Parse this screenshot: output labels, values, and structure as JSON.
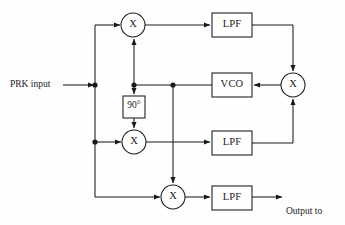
{
  "diagram": {
    "type": "block-diagram",
    "background_color": "#fefefe",
    "line_color": "#1a1a1a",
    "text_color": "#1a1a1a",
    "inputs": [
      {
        "id": "prk-input",
        "label": "PRK input"
      }
    ],
    "outputs": [
      {
        "id": "output-decision",
        "line1": "Output to",
        "line2": "decision",
        "line3": "threshold"
      }
    ],
    "blocks": [
      {
        "id": "mixer-top",
        "kind": "multiplier",
        "label": "X",
        "cx": 133,
        "cy": 25,
        "r": 12
      },
      {
        "id": "phase-shift-90",
        "kind": "box",
        "label": "90°",
        "x": 123,
        "y": 96,
        "w": 22,
        "h": 22
      },
      {
        "id": "mixer-middle",
        "kind": "multiplier",
        "label": "X",
        "cx": 134,
        "cy": 142,
        "r": 12
      },
      {
        "id": "mixer-bottom",
        "kind": "multiplier",
        "label": "X",
        "cx": 173,
        "cy": 197,
        "r": 12
      },
      {
        "id": "lpf-top",
        "kind": "box",
        "label": "LPF",
        "x": 212,
        "y": 13,
        "w": 40,
        "h": 24
      },
      {
        "id": "lpf-middle",
        "kind": "box",
        "label": "LPF",
        "x": 212,
        "y": 131,
        "w": 40,
        "h": 24
      },
      {
        "id": "lpf-bottom",
        "kind": "box",
        "label": "LPF",
        "x": 212,
        "y": 186,
        "w": 40,
        "h": 24
      },
      {
        "id": "vco",
        "kind": "box",
        "label": "VCO",
        "x": 212,
        "y": 73,
        "w": 40,
        "h": 24
      },
      {
        "id": "mixer-right",
        "kind": "multiplier",
        "label": "X",
        "cx": 293,
        "cy": 85,
        "r": 12
      }
    ],
    "junction_dots": [
      {
        "id": "dot-input-bus",
        "x": 95,
        "y": 85
      },
      {
        "id": "dot-lower-bus",
        "x": 95,
        "y": 142
      },
      {
        "id": "dot-vco-branch",
        "x": 173,
        "y": 85
      },
      {
        "id": "dot-phase-branch",
        "x": 134,
        "y": 85
      }
    ],
    "connections": [
      {
        "from": "prk-input",
        "to": "dot-input-bus"
      },
      {
        "from": "dot-input-bus",
        "to": "mixer-top"
      },
      {
        "from": "dot-lower-bus",
        "to": "mixer-middle"
      },
      {
        "from": "dot-lower-bus",
        "to": "mixer-bottom"
      },
      {
        "from": "mixer-top",
        "to": "lpf-top"
      },
      {
        "from": "mixer-middle",
        "to": "lpf-middle"
      },
      {
        "from": "mixer-bottom",
        "to": "lpf-bottom"
      },
      {
        "from": "lpf-top",
        "to": "mixer-right"
      },
      {
        "from": "lpf-middle",
        "to": "mixer-right"
      },
      {
        "from": "mixer-right",
        "to": "vco"
      },
      {
        "from": "vco",
        "to": "dot-vco-branch"
      },
      {
        "from": "dot-vco-branch",
        "to": "dot-phase-branch"
      },
      {
        "from": "dot-phase-branch",
        "to": "mixer-top"
      },
      {
        "from": "dot-phase-branch",
        "to": "phase-shift-90"
      },
      {
        "from": "phase-shift-90",
        "to": "mixer-middle"
      },
      {
        "from": "dot-vco-branch",
        "to": "mixer-bottom"
      },
      {
        "from": "lpf-bottom",
        "to": "output-decision"
      }
    ]
  }
}
